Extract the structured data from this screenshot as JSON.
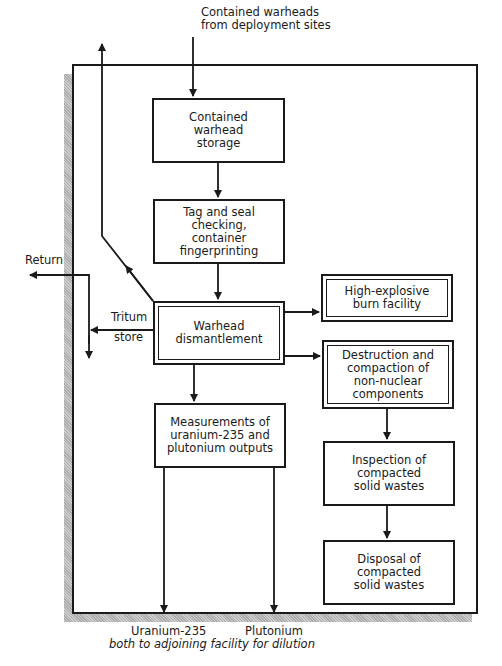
{
  "diagram": {
    "inputs": {
      "top": "Contained warheads\nfrom deployment sites"
    },
    "boxes": [
      {
        "id": "storage",
        "label": "Contained\nwarhead\nstorage",
        "style": "single"
      },
      {
        "id": "tag_seal",
        "label": "Tag and seal\nchecking,\ncontainer\nfingerprinting",
        "style": "single"
      },
      {
        "id": "dismantlement",
        "label": "Warhead\ndismantlement",
        "style": "double"
      },
      {
        "id": "he_burn",
        "label": "High-explosive\nburn facility",
        "style": "double"
      },
      {
        "id": "destruction",
        "label": "Destruction and\ncompaction of\nnon-nuclear\ncomponents",
        "style": "double"
      },
      {
        "id": "measurements",
        "label": "Measurements of\nuranium-235 and\nplutonium outputs",
        "style": "single"
      },
      {
        "id": "inspection",
        "label": "Inspection of\ncompacted\nsolid wastes",
        "style": "single"
      },
      {
        "id": "disposal",
        "label": "Disposal of\ncompacted\nsolid wastes",
        "style": "single"
      }
    ],
    "side_labels": {
      "return": "Return",
      "tritium_line1": "Tritum",
      "tritium_line2": "store"
    },
    "outputs": {
      "uranium": "Uranium-235",
      "plutonium": "Plutonium",
      "note": "both to adjoining facility for dilution"
    },
    "edges": [
      {
        "from": "external",
        "to": "storage"
      },
      {
        "from": "storage",
        "to": "tag_seal"
      },
      {
        "from": "tag_seal",
        "to": "dismantlement"
      },
      {
        "from": "dismantlement",
        "to": "he_burn"
      },
      {
        "from": "dismantlement",
        "to": "destruction"
      },
      {
        "from": "dismantlement",
        "to": "measurements"
      },
      {
        "from": "dismantlement",
        "to": "return"
      },
      {
        "from": "dismantlement",
        "to": "tritium_store"
      },
      {
        "from": "destruction",
        "to": "inspection"
      },
      {
        "from": "inspection",
        "to": "disposal"
      },
      {
        "from": "measurements",
        "to": "uranium_out"
      },
      {
        "from": "measurements",
        "to": "plutonium_out"
      }
    ]
  }
}
